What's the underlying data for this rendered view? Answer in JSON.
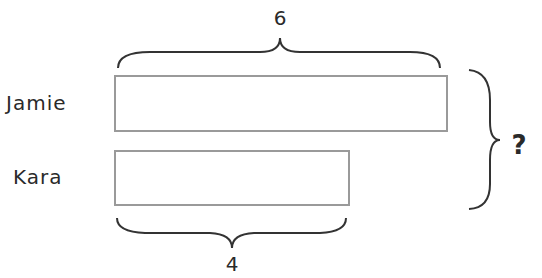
{
  "diagram": {
    "type": "tape-diagram",
    "rows": [
      {
        "name": "Jamie",
        "value": "6"
      },
      {
        "name": "Kara",
        "value": "4"
      }
    ],
    "top_brace_label": "6",
    "bottom_brace_label": "4",
    "total_label": "?",
    "colors": {
      "bar_border": "#9a9a9a",
      "text": "#2a2a2a",
      "brace": "#333333"
    }
  }
}
